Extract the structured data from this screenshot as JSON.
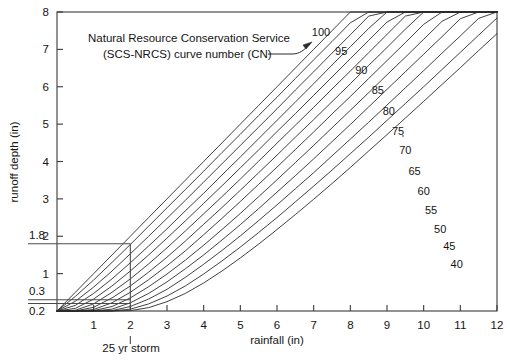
{
  "figure": {
    "title": "",
    "annotation_line1": "Natural Resource Conservation Service",
    "annotation_line2": "(SCS-NRCS) curve number (CN)",
    "storm_label": "25 yr storm"
  },
  "axes": {
    "xlabel": "rainfall (in)",
    "ylabel": "runoff depth (in)",
    "xticks": [
      "1",
      "2",
      "3",
      "4",
      "5",
      "6",
      "7",
      "8",
      "9",
      "10",
      "11",
      "12"
    ],
    "yticks": [
      "1",
      "2",
      "3",
      "4",
      "5",
      "6",
      "7",
      "8"
    ],
    "xlim": [
      0,
      12
    ],
    "ylim": [
      0,
      8
    ]
  },
  "guides": {
    "y_labels": [
      "1.8",
      "0.3",
      "0.2"
    ],
    "y_values": [
      1.8,
      0.3,
      0.2
    ],
    "x_value": 2
  },
  "colors": {
    "curve": "#2b2b2b",
    "frame": "#3a3a3a",
    "guide": "#4a4a4a",
    "background": "#ffffff"
  },
  "chart_data": {
    "type": "line",
    "xlabel": "rainfall (in)",
    "ylabel": "runoff depth (in)",
    "xlim": [
      0,
      12
    ],
    "ylim": [
      0,
      8
    ],
    "grid": false,
    "legend": "inline-curve-labels",
    "annotations": [
      {
        "text": "Natural Resource Conservation Service (SCS-NRCS) curve number (CN)",
        "x": 1.2,
        "y": 7.3
      },
      {
        "text": "25 yr storm",
        "x": 2,
        "y": -0.75
      },
      {
        "text": "1.8",
        "x": -0.9,
        "y": 1.8
      },
      {
        "text": "0.3",
        "x": -0.9,
        "y": 0.3
      },
      {
        "text": "0.2",
        "x": -0.9,
        "y": 0.2
      }
    ],
    "x": [
      0,
      0.5,
      1,
      1.5,
      2,
      2.5,
      3,
      3.5,
      4,
      4.5,
      5,
      5.5,
      6,
      6.5,
      7,
      7.5,
      8,
      8.5,
      9,
      9.5,
      10,
      10.5,
      11,
      11.5,
      12
    ],
    "series": [
      {
        "name": "100",
        "cn": 100,
        "label_x": 7.2,
        "label_y": 7.35,
        "values": [
          0,
          0.5,
          1,
          1.5,
          2,
          2.5,
          3,
          3.5,
          4,
          4.5,
          5,
          5.5,
          6,
          6.5,
          7,
          7.5,
          8,
          8,
          8,
          8,
          8,
          8,
          8,
          8,
          8
        ]
      },
      {
        "name": "95",
        "cn": 95,
        "label_x": 7.75,
        "label_y": 6.85,
        "values": [
          0,
          0.39,
          0.83,
          1.3,
          1.78,
          2.27,
          2.76,
          3.25,
          3.74,
          4.24,
          4.73,
          5.23,
          5.72,
          6.22,
          6.72,
          7.21,
          7.71,
          8,
          8,
          8,
          8,
          8,
          8,
          8,
          8
        ]
      },
      {
        "name": "90",
        "cn": 90,
        "label_x": 8.3,
        "label_y": 6.35,
        "values": [
          0,
          0.26,
          0.64,
          1.07,
          1.53,
          2.0,
          2.48,
          2.96,
          3.45,
          3.94,
          4.43,
          4.92,
          5.41,
          5.91,
          6.4,
          6.9,
          7.39,
          7.89,
          8,
          8,
          8,
          8,
          8,
          8,
          8
        ]
      },
      {
        "name": "85",
        "cn": 85,
        "label_x": 8.75,
        "label_y": 5.8,
        "values": [
          0,
          0.15,
          0.47,
          0.86,
          1.29,
          1.74,
          2.2,
          2.68,
          3.15,
          3.64,
          4.12,
          4.61,
          5.1,
          5.59,
          6.08,
          6.58,
          7.07,
          7.56,
          8,
          8,
          8,
          8,
          8,
          8,
          8
        ]
      },
      {
        "name": "80",
        "cn": 80,
        "label_x": 9.05,
        "label_y": 5.25,
        "values": [
          0,
          0.07,
          0.32,
          0.67,
          1.07,
          1.5,
          1.95,
          2.41,
          2.88,
          3.35,
          3.83,
          4.31,
          4.8,
          5.28,
          5.77,
          6.26,
          6.75,
          7.24,
          7.73,
          8,
          8,
          8,
          8,
          8,
          8
        ]
      },
      {
        "name": "75",
        "cn": 75,
        "label_x": 9.3,
        "label_y": 4.72,
        "values": [
          0,
          0.02,
          0.19,
          0.5,
          0.86,
          1.26,
          1.69,
          2.14,
          2.6,
          3.06,
          3.53,
          4.01,
          4.49,
          4.97,
          5.45,
          5.94,
          6.42,
          6.91,
          7.4,
          7.89,
          8,
          8,
          8,
          8,
          8
        ]
      },
      {
        "name": "70",
        "cn": 70,
        "label_x": 9.5,
        "label_y": 4.2,
        "values": [
          0,
          0,
          0.1,
          0.35,
          0.67,
          1.04,
          1.44,
          1.87,
          2.32,
          2.77,
          3.23,
          3.7,
          4.17,
          4.65,
          5.12,
          5.6,
          6.08,
          6.57,
          7.05,
          7.54,
          8,
          8,
          8,
          8,
          8
        ]
      },
      {
        "name": "65",
        "cn": 65,
        "label_x": 9.75,
        "label_y": 3.65,
        "values": [
          0,
          0,
          0.04,
          0.22,
          0.5,
          0.84,
          1.21,
          1.61,
          2.04,
          2.48,
          2.93,
          3.39,
          3.85,
          4.32,
          4.79,
          5.27,
          5.74,
          6.22,
          6.7,
          7.18,
          7.67,
          8,
          8,
          8,
          8
        ]
      },
      {
        "name": "60",
        "cn": 60,
        "label_x": 10.0,
        "label_y": 3.1,
        "values": [
          0,
          0,
          0.01,
          0.12,
          0.35,
          0.65,
          0.99,
          1.36,
          1.76,
          2.18,
          2.61,
          3.06,
          3.51,
          3.97,
          4.43,
          4.9,
          5.37,
          5.84,
          6.32,
          6.79,
          7.27,
          7.75,
          8,
          8,
          8
        ]
      },
      {
        "name": "55",
        "cn": 55,
        "label_x": 10.2,
        "label_y": 2.6,
        "values": [
          0,
          0,
          0,
          0.05,
          0.22,
          0.47,
          0.78,
          1.13,
          1.5,
          1.9,
          2.31,
          2.74,
          3.18,
          3.62,
          4.07,
          4.53,
          4.99,
          5.46,
          5.93,
          6.4,
          6.87,
          7.34,
          7.82,
          8,
          8
        ]
      },
      {
        "name": "50",
        "cn": 50,
        "label_x": 10.45,
        "label_y": 2.1,
        "values": [
          0,
          0,
          0,
          0.01,
          0.12,
          0.32,
          0.58,
          0.9,
          1.25,
          1.62,
          2.01,
          2.42,
          2.84,
          3.27,
          3.7,
          4.15,
          4.6,
          5.05,
          5.51,
          5.97,
          6.43,
          6.9,
          7.36,
          7.83,
          8
        ]
      },
      {
        "name": "45",
        "cn": 45,
        "label_x": 10.7,
        "label_y": 1.62,
        "values": [
          0,
          0,
          0,
          0,
          0.05,
          0.19,
          0.4,
          0.67,
          0.99,
          1.34,
          1.71,
          2.1,
          2.5,
          2.92,
          3.34,
          3.77,
          4.21,
          4.65,
          5.1,
          5.55,
          6.0,
          6.46,
          6.92,
          7.38,
          7.84
        ]
      },
      {
        "name": "40",
        "cn": 40,
        "label_x": 10.9,
        "label_y": 1.15,
        "values": [
          0,
          0,
          0,
          0,
          0.01,
          0.09,
          0.25,
          0.47,
          0.75,
          1.07,
          1.42,
          1.79,
          2.18,
          2.58,
          2.99,
          3.41,
          3.84,
          4.28,
          4.72,
          5.16,
          5.61,
          6.06,
          6.51,
          6.97,
          7.42
        ]
      }
    ]
  }
}
